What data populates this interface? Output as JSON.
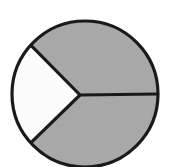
{
  "figure": {
    "background_color": "#ffffff",
    "outline_color": "#1a1a1a",
    "shaded_color": "#a8a8a8",
    "unshaded_color": "#ffffff",
    "outline_width_px": 3.2
  },
  "chart_data": {
    "type": "pie",
    "title": "",
    "subtitle": "",
    "xlabel": "",
    "ylabel": "",
    "legend_position": "none",
    "grid": false,
    "center_x": 80,
    "center_y": 95,
    "radius": 73,
    "total_parts": 3,
    "shaded_parts": 2,
    "fraction_shaded": "2/3",
    "categories": [
      "shaded-upper-right",
      "shaded-lower-right",
      "unshaded-left"
    ],
    "values": [
      33.3,
      33.3,
      33.3
    ],
    "slices": [
      {
        "name": "shaded-upper-right",
        "label": "",
        "value": 33.3,
        "shaded": true,
        "color": "#a8a8a8",
        "start_angle_deg": 0,
        "end_angle_deg": 138
      },
      {
        "name": "shaded-lower-right",
        "label": "",
        "value": 33.3,
        "shaded": true,
        "color": "#a8a8a8",
        "start_angle_deg": 222,
        "end_angle_deg": 360
      },
      {
        "name": "unshaded-left",
        "label": "",
        "value": 33.3,
        "shaded": false,
        "color": "#ffffff",
        "start_angle_deg": 138,
        "end_angle_deg": 222
      }
    ],
    "dividers": [
      {
        "name": "divider-upper-left",
        "angle_deg": 138,
        "end_x": 49,
        "end_y": 39
      },
      {
        "name": "divider-right",
        "angle_deg": 0,
        "end_x": 159,
        "end_y": 95
      },
      {
        "name": "divider-lower-left",
        "angle_deg": 222,
        "end_x": 53,
        "end_y": 159
      }
    ]
  }
}
